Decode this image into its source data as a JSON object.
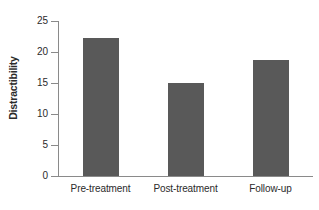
{
  "chart_data": {
    "type": "bar",
    "title": "",
    "subtitle": "",
    "xlabel": "",
    "ylabel": "Distractibility",
    "categories": [
      "Pre-treatment",
      "Post-treatment",
      "Follow-up"
    ],
    "values": [
      22.2,
      15.0,
      18.7
    ],
    "series": [
      {
        "name": "Distractibility",
        "values": [
          22.2,
          15.0,
          18.7
        ],
        "color": "#595959"
      }
    ],
    "ylim": [
      0,
      25
    ],
    "yticks": [
      0,
      5,
      10,
      15,
      20,
      25
    ],
    "ytick_labels": [
      "0",
      "5",
      "10",
      "15",
      "20",
      "25"
    ],
    "grid": false,
    "legend": false,
    "legend_position": "none",
    "bar_color": "#595959",
    "axis_color": "#8a8a8a",
    "text_color": "#2b2b2b",
    "background": "#ffffff"
  }
}
